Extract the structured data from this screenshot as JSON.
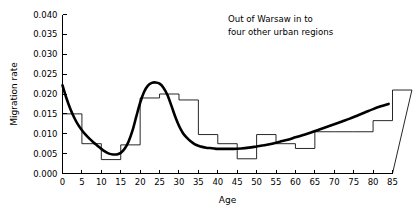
{
  "chart_data": {
    "type": "line",
    "title": "",
    "annotation": [
      "Out of Warsaw in to",
      "four other urban regions"
    ],
    "xlabel": "Age",
    "ylabel": "Migration rate",
    "xlim": [
      0,
      85
    ],
    "ylim": [
      0.0,
      0.04
    ],
    "grid": false,
    "legend": "none",
    "xticks": [
      0,
      5,
      10,
      15,
      20,
      25,
      30,
      35,
      40,
      45,
      50,
      55,
      60,
      65,
      70,
      75,
      80,
      85
    ],
    "xtick_labels": [
      "0",
      "5",
      "10",
      "15",
      "20",
      "25",
      "30",
      "35",
      "40",
      "45",
      "50",
      "55",
      "60",
      "65",
      "70",
      "75",
      "80",
      "85"
    ],
    "yticks": [
      0.0,
      0.005,
      0.01,
      0.015,
      0.02,
      0.025,
      0.03,
      0.035,
      0.04
    ],
    "ytick_labels": [
      "0.000",
      "0.005",
      "0.010",
      "0.015",
      "0.020",
      "0.025",
      "0.030",
      "0.035",
      "0.040"
    ],
    "series": [
      {
        "name": "observed-histogram",
        "type": "step",
        "bin_edges": [
          0,
          5,
          10,
          15,
          20,
          25,
          30,
          35,
          40,
          45,
          50,
          55,
          60,
          65,
          70,
          75,
          80,
          85
        ],
        "values": [
          0.015,
          0.0075,
          0.0035,
          0.0072,
          0.019,
          0.02,
          0.0185,
          0.0098,
          0.0075,
          0.0037,
          0.0098,
          0.0075,
          0.0063,
          0.0105,
          0.0105,
          0.0105,
          0.0133,
          0.021
        ]
      },
      {
        "name": "fitted-model-curve",
        "type": "line",
        "x": [
          0,
          1,
          2,
          3,
          4,
          5,
          6,
          7,
          8,
          9,
          10,
          11,
          12,
          13,
          14,
          15,
          16,
          17,
          18,
          19,
          20,
          21,
          22,
          23,
          24,
          25,
          26,
          27,
          28,
          29,
          30,
          31,
          32,
          33,
          34,
          35,
          36,
          37,
          38,
          39,
          40,
          42,
          44,
          46,
          48,
          50,
          52,
          54,
          56,
          58,
          60,
          62,
          64,
          66,
          68,
          70,
          72,
          74,
          76,
          78,
          80,
          82,
          84
        ],
        "y": [
          0.0222,
          0.019,
          0.0163,
          0.0141,
          0.0123,
          0.0109,
          0.0097,
          0.0087,
          0.0078,
          0.007,
          0.0062,
          0.0055,
          0.005,
          0.0048,
          0.0048,
          0.0052,
          0.0062,
          0.008,
          0.0107,
          0.0143,
          0.0178,
          0.0205,
          0.0221,
          0.0228,
          0.0229,
          0.0226,
          0.0216,
          0.0198,
          0.0172,
          0.0144,
          0.012,
          0.0102,
          0.009,
          0.0081,
          0.0074,
          0.007,
          0.0067,
          0.0065,
          0.0064,
          0.0063,
          0.0062,
          0.0062,
          0.0062,
          0.0063,
          0.0065,
          0.0068,
          0.0071,
          0.0075,
          0.008,
          0.0085,
          0.0091,
          0.0097,
          0.0103,
          0.011,
          0.0117,
          0.0124,
          0.0131,
          0.0138,
          0.0146,
          0.0154,
          0.0162,
          0.0169,
          0.0175
        ]
      }
    ]
  }
}
